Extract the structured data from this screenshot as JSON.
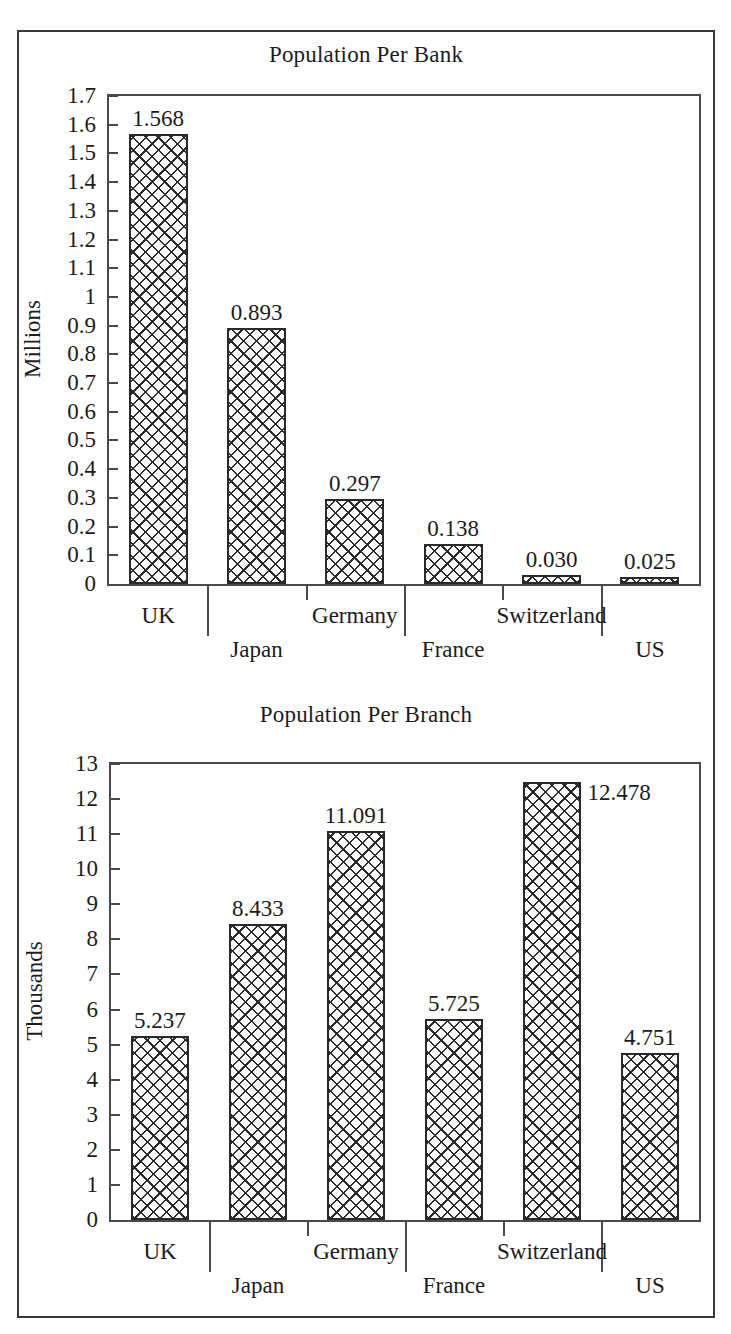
{
  "page": {
    "background": "#ffffff",
    "border_color": "#3a3a3a"
  },
  "chart_data": [
    {
      "type": "bar",
      "id": "population-per-bank",
      "title": "Population Per Bank",
      "xlabel": "",
      "ylabel": "Millions",
      "categories": [
        "UK",
        "Japan",
        "Germany",
        "France",
        "Switzerland",
        "US"
      ],
      "values": [
        1.568,
        0.893,
        0.297,
        0.138,
        0.03,
        0.025
      ],
      "value_labels": [
        "1.568",
        "0.893",
        "0.297",
        "0.138",
        "0.030",
        "0.025"
      ],
      "label_positions": [
        "above",
        "above",
        "above",
        "above",
        "above",
        "above"
      ],
      "ylim": [
        0,
        1.7
      ],
      "ytick_step": 0.1,
      "yticks": [
        "1.7",
        "1.6",
        "1.5",
        "1.4",
        "1.3",
        "1.2",
        "1.1",
        "1",
        "0.9",
        "0.8",
        "0.7",
        "0.6",
        "0.5",
        "0.4",
        "0.3",
        "0.2",
        "0.1",
        "0"
      ],
      "ytick_values": [
        1.7,
        1.6,
        1.5,
        1.4,
        1.3,
        1.2,
        1.1,
        1,
        0.9,
        0.8,
        0.7,
        0.6,
        0.5,
        0.4,
        0.3,
        0.2,
        0.1,
        0
      ],
      "grid": false,
      "legend": "none",
      "bar_fill": "crosshatch",
      "bar_edge_color": "#2a2a2a"
    },
    {
      "type": "bar",
      "id": "population-per-branch",
      "title": "Population Per Branch",
      "xlabel": "",
      "ylabel": "Thousands",
      "categories": [
        "UK",
        "Japan",
        "Germany",
        "France",
        "Switzerland",
        "US"
      ],
      "values": [
        5.237,
        8.433,
        11.091,
        5.725,
        12.478,
        4.751
      ],
      "value_labels": [
        "5.237",
        "8.433",
        "11.091",
        "5.725",
        "12.478",
        "4.751"
      ],
      "label_positions": [
        "above",
        "above",
        "above",
        "above",
        "right",
        "above"
      ],
      "ylim": [
        0,
        13
      ],
      "ytick_step": 1,
      "yticks": [
        "13",
        "12",
        "11",
        "10",
        "9",
        "8",
        "7",
        "6",
        "5",
        "4",
        "3",
        "2",
        "1",
        "0"
      ],
      "ytick_values": [
        13,
        12,
        11,
        10,
        9,
        8,
        7,
        6,
        5,
        4,
        3,
        2,
        1,
        0
      ],
      "grid": false,
      "legend": "none",
      "bar_fill": "crosshatch",
      "bar_edge_color": "#2a2a2a"
    }
  ],
  "bottom_caption": ""
}
